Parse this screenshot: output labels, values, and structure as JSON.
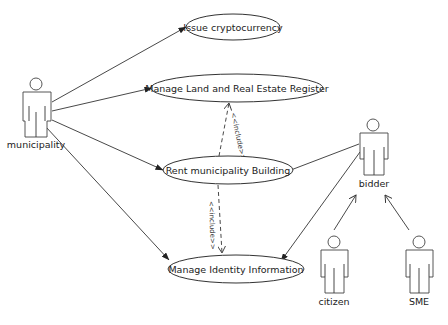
{
  "diagram": {
    "type": "uml-use-case",
    "actors": [
      {
        "id": "municipality",
        "label": "municipality"
      },
      {
        "id": "bidder",
        "label": "bidder"
      },
      {
        "id": "citizen",
        "label": "citizen"
      },
      {
        "id": "sme",
        "label": "SME"
      }
    ],
    "use_cases": [
      {
        "id": "issue",
        "label": "Issue cryptocurrency"
      },
      {
        "id": "land",
        "label": "Manage Land and Real Estate Register"
      },
      {
        "id": "rent",
        "label": "Rent municipality Building"
      },
      {
        "id": "identity",
        "label": "Manage Identity Information"
      }
    ],
    "relations": [
      {
        "from": "municipality",
        "to": "issue",
        "kind": "association"
      },
      {
        "from": "municipality",
        "to": "land",
        "kind": "association"
      },
      {
        "from": "municipality",
        "to": "rent",
        "kind": "association"
      },
      {
        "from": "municipality",
        "to": "identity",
        "kind": "association"
      },
      {
        "from": "bidder",
        "to": "rent",
        "kind": "association"
      },
      {
        "from": "bidder",
        "to": "identity",
        "kind": "association"
      },
      {
        "from": "rent",
        "to": "land",
        "kind": "include",
        "label": "<<include>>"
      },
      {
        "from": "rent",
        "to": "identity",
        "kind": "include",
        "label": "<<include>>"
      },
      {
        "from": "citizen",
        "to": "bidder",
        "kind": "generalization"
      },
      {
        "from": "sme",
        "to": "bidder",
        "kind": "generalization"
      }
    ],
    "include_label": "<<include>>"
  }
}
